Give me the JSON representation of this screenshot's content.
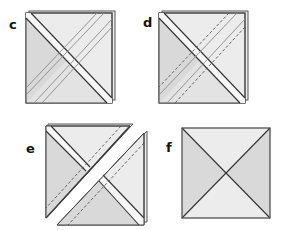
{
  "diagram": {
    "colors": {
      "light_fabric": "#ececec",
      "medium_fabric": "#d9d9d9",
      "outline": "#333333",
      "seam_line": "#888888",
      "dashed_line": "#555555",
      "background": "#ffffff"
    },
    "panels": [
      {
        "id": "c",
        "label": "c",
        "description": "Two stacked squares with diagonal strip and two parallel stitched seams on the anti-diagonal"
      },
      {
        "id": "d",
        "label": "d",
        "description": "Two stacked squares with diagonal strip; anti-diagonal shows two dashed cutting guides outside a pair of seam lines"
      },
      {
        "id": "e",
        "label": "e",
        "description": "Stacked squares cut apart along the anti-diagonal into two triangle units, separated by a gap"
      },
      {
        "id": "f",
        "label": "f",
        "description": "Finished quarter-square triangle block with darker left/right triangles and lighter top/bottom triangles"
      }
    ]
  }
}
